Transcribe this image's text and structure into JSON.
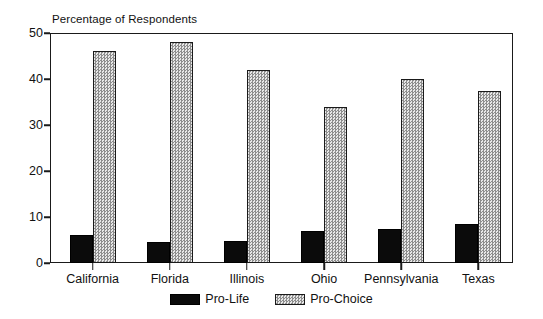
{
  "chart_data": {
    "type": "bar",
    "title": "Percentage of Respondents",
    "xlabel": "",
    "ylabel": "",
    "ylim": [
      0,
      50
    ],
    "yticks": [
      0,
      10,
      20,
      30,
      40,
      50
    ],
    "grid": false,
    "legend_position": "bottom-center",
    "categories": [
      "California",
      "Florida",
      "Illinois",
      "Ohio",
      "Pennsylvania",
      "Texas"
    ],
    "series": [
      {
        "name": "Pro-Life",
        "color": "#0b0b0b",
        "pattern": "solid-black",
        "values": [
          6,
          4.5,
          4.8,
          7,
          7.5,
          8.5
        ]
      },
      {
        "name": "Pro-Choice",
        "color": "#d2d2d2",
        "pattern": "gray-stipple",
        "values": [
          46,
          48,
          42,
          34,
          40,
          37.5
        ]
      }
    ]
  },
  "axis": {
    "tick_labels": [
      "50",
      "40",
      "30",
      "20",
      "10",
      "0"
    ]
  }
}
